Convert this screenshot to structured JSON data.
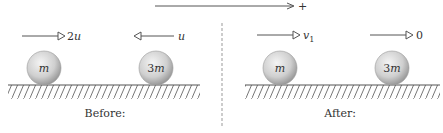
{
  "diagram": {
    "direction_label": "+",
    "colors": {
      "line": "#555555",
      "ball_light": "#f2f2f2",
      "ball_dark": "#9a9a9a",
      "text": "#333333",
      "divider": "#999999"
    },
    "panels": [
      {
        "caption": "Before:",
        "balls": [
          {
            "label": "m",
            "velocity_label_num": "2",
            "velocity_label_var": "u",
            "velocity_direction": "right"
          },
          {
            "label_num": "3",
            "label_var": "m",
            "velocity_label_var": "u",
            "velocity_direction": "left"
          }
        ]
      },
      {
        "caption": "After:",
        "balls": [
          {
            "label": "m",
            "velocity_label_var": "v",
            "velocity_label_sub": "1",
            "velocity_direction": "right"
          },
          {
            "label_num": "3",
            "label_var": "m",
            "velocity_label": "0",
            "velocity_direction": "right"
          }
        ]
      }
    ]
  }
}
